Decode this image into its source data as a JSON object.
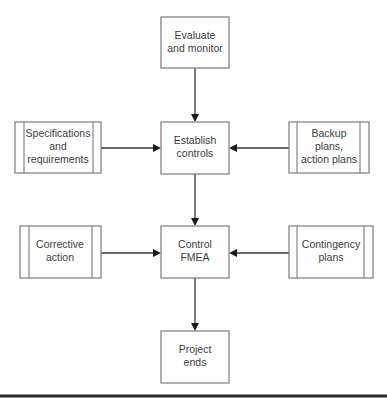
{
  "diagram": {
    "nodes": {
      "evaluate": {
        "lines": [
          "Evaluate",
          "and monitor"
        ],
        "kind": "process"
      },
      "establish": {
        "lines": [
          "Establish",
          "controls"
        ],
        "kind": "process"
      },
      "specs": {
        "lines": [
          "Specifications",
          "and",
          "requirements"
        ],
        "kind": "predefined"
      },
      "backup": {
        "lines": [
          "Backup",
          "plans,",
          "action plans"
        ],
        "kind": "predefined"
      },
      "control": {
        "lines": [
          "Control",
          "FMEA"
        ],
        "kind": "process"
      },
      "corrective": {
        "lines": [
          "Corrective",
          "action"
        ],
        "kind": "predefined"
      },
      "contingency": {
        "lines": [
          "Contingency",
          "plans"
        ],
        "kind": "predefined"
      },
      "ends": {
        "lines": [
          "Project",
          "ends"
        ],
        "kind": "process"
      }
    },
    "edges": [
      {
        "from": "evaluate",
        "to": "establish"
      },
      {
        "from": "specs",
        "to": "establish"
      },
      {
        "from": "backup",
        "to": "establish"
      },
      {
        "from": "establish",
        "to": "control"
      },
      {
        "from": "corrective",
        "to": "control"
      },
      {
        "from": "contingency",
        "to": "control"
      },
      {
        "from": "control",
        "to": "ends"
      }
    ]
  }
}
